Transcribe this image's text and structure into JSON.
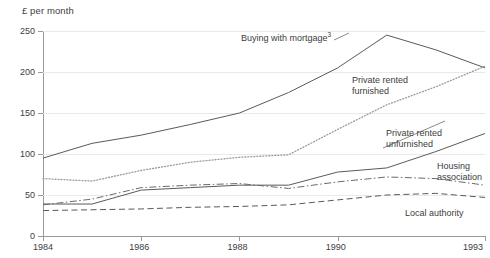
{
  "chart_data": {
    "type": "line",
    "title": "",
    "ylabel": "£ per month",
    "xlabel": "",
    "grid": true,
    "legend_position": "inline-annotations",
    "x": [
      1984,
      1985,
      1986,
      1987,
      1988,
      1989,
      1990,
      1991,
      1992,
      1993
    ],
    "xticks": [
      "1984",
      "1986",
      "1988",
      "1990",
      "1993"
    ],
    "xtick_values": [
      1984,
      1986,
      1988,
      1990,
      1993
    ],
    "yticks": [
      "0",
      "50",
      "100",
      "150",
      "200",
      "250"
    ],
    "ytick_values": [
      0,
      50,
      100,
      150,
      200,
      250
    ],
    "ylim": [
      0,
      250
    ],
    "xlim": [
      1984,
      1993
    ],
    "series": [
      {
        "name": "Buying with mortgage",
        "label": "Buying with mortgage",
        "superscript": "3",
        "style": "solid",
        "color": "#5a5a5a",
        "values": [
          95,
          113,
          123,
          136,
          150,
          175,
          205,
          245,
          227,
          205
        ]
      },
      {
        "name": "Private rented furnished",
        "label": "Private rented\nfurnished",
        "style": "dotted",
        "color": "#9a9a9a",
        "values": [
          70,
          67,
          80,
          90,
          96,
          99,
          130,
          160,
          182,
          207
        ]
      },
      {
        "name": "Private rented unfurnished",
        "label": "Private rented\nunfurnished",
        "style": "solid",
        "color": "#5a5a5a",
        "values": [
          39,
          39,
          56,
          59,
          62,
          62,
          78,
          83,
          103,
          125
        ]
      },
      {
        "name": "Housing association",
        "label": "Housing\nassociation",
        "style": "dash-dot",
        "color": "#6a6a6a",
        "values": [
          38,
          45,
          59,
          62,
          64,
          58,
          66,
          72,
          70,
          62
        ]
      },
      {
        "name": "Local authority",
        "label": "Local authority",
        "style": "dashed",
        "color": "#5a5a5a",
        "values": [
          31,
          32,
          33,
          35,
          36,
          38,
          44,
          50,
          52,
          47
        ]
      }
    ]
  }
}
